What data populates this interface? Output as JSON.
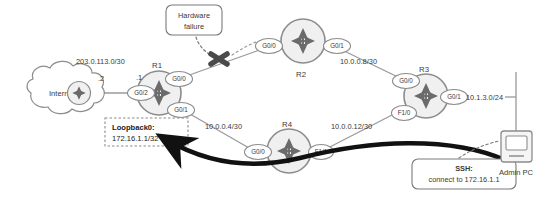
{
  "diagram": {
    "colors": {
      "device_stroke": "#8c8c8c",
      "device_fill": "#f0f0f0",
      "link": "#9a9a9a",
      "text": "#3a3a3a",
      "failure_mark": "#4a4a4a",
      "thick_arrow": "#111111",
      "callout_stroke": "#7a7a7a"
    },
    "cloud": {
      "name": "internet-cloud",
      "label": "Internet"
    },
    "routers": [
      {
        "id": "r1",
        "label": "R1",
        "interfaces": [
          "G0/2",
          "G0/0",
          "G0/1"
        ]
      },
      {
        "id": "r2",
        "label": "R2",
        "interfaces": [
          "G0/0",
          "G0/1"
        ]
      },
      {
        "id": "r3",
        "label": "R3",
        "interfaces": [
          "G0/0",
          "G0/1",
          "F1/0"
        ]
      },
      {
        "id": "r4",
        "label": "R4",
        "interfaces": [
          "G0/0",
          "F1/1"
        ]
      }
    ],
    "interface_labels": {
      "r1_g0_2": "G0/2",
      "r1_g0_0": "G0/0",
      "r1_g0_1": "G0/1",
      "r2_g0_0": "G0/0",
      "r2_g0_1": "G0/1",
      "r3_g0_0": "G0/0",
      "r3_g0_1": "G0/1",
      "r3_f1_0": "F1/0",
      "r4_g0_0": "G0/0",
      "r4_f1_1": "F1/1"
    },
    "networks": {
      "internet_link": "203.0.113.0/30",
      "internet_octet": ".2",
      "r1_octet": ".1",
      "r2_r3_link": "10.0.0.8/30",
      "r1_r4_link": "10.0.0.4/30",
      "r4_r3_link": "10.0.0.12/30",
      "r3_lan": "10.1.3.0/24"
    },
    "callouts": {
      "hardware_failure": {
        "name": "hardware-failure-callout",
        "line1": "Hardware",
        "line2": "failure"
      },
      "loopback": {
        "name": "loopback-callout",
        "line1": "Loopback0:",
        "line2": "172.16.1.1/32"
      },
      "ssh": {
        "name": "ssh-callout",
        "line1": "SSH:",
        "line2": "connect to 172.16.1.1"
      }
    },
    "admin_pc": {
      "name": "admin-pc",
      "label": "Admin PC"
    }
  }
}
